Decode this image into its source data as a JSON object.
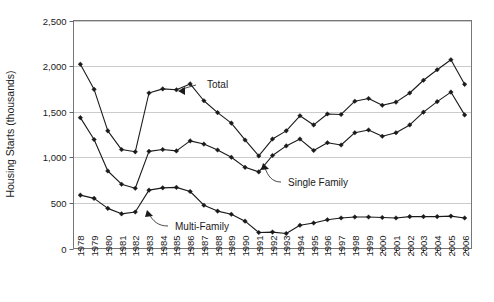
{
  "chart_data": {
    "type": "line",
    "title": "",
    "xlabel": "",
    "ylabel": "Housing Starts (thousands)",
    "ylim": [
      0,
      2500
    ],
    "yticks": [
      0,
      500,
      1000,
      1500,
      2000,
      2500
    ],
    "ytick_labels": [
      "0",
      "500",
      "1,000",
      "1,500",
      "2,000",
      "2,500"
    ],
    "grid": true,
    "legend_position": "inline-annotations",
    "categories": [
      "1978",
      "1979",
      "1980",
      "1981",
      "1982",
      "1983",
      "1984",
      "1985",
      "1986",
      "1987",
      "1988",
      "1989",
      "1990",
      "1991",
      "1992",
      "1993",
      "1994",
      "1995",
      "1996",
      "1997",
      "1998",
      "1999",
      "2000",
      "2001",
      "2002",
      "2003",
      "2004",
      "2005",
      "2006"
    ],
    "series": [
      {
        "name": "Total",
        "values": [
          2020,
          1745,
          1290,
          1085,
          1060,
          1705,
          1750,
          1740,
          1805,
          1620,
          1490,
          1375,
          1190,
          1015,
          1200,
          1290,
          1455,
          1355,
          1475,
          1470,
          1615,
          1645,
          1570,
          1605,
          1705,
          1845,
          1960,
          2070,
          1800
        ]
      },
      {
        "name": "Single Family",
        "values": [
          1435,
          1195,
          850,
          705,
          660,
          1065,
          1085,
          1070,
          1180,
          1145,
          1080,
          1000,
          890,
          840,
          1020,
          1125,
          1200,
          1075,
          1160,
          1135,
          1270,
          1300,
          1230,
          1270,
          1355,
          1495,
          1610,
          1715,
          1465
        ]
      },
      {
        "name": "Multi-Family",
        "values": [
          585,
          550,
          440,
          380,
          400,
          640,
          665,
          670,
          625,
          475,
          410,
          375,
          300,
          175,
          180,
          165,
          255,
          280,
          315,
          335,
          345,
          345,
          340,
          335,
          350,
          350,
          350,
          355,
          335
        ]
      }
    ],
    "annotations": [
      {
        "text": "Total",
        "series": "Total",
        "anchor_year": "1986"
      },
      {
        "text": "Single Family",
        "series": "Single Family",
        "anchor_year": "1991"
      },
      {
        "text": "Multi-Family",
        "series": "Multi-Family",
        "anchor_year": "1982"
      }
    ],
    "colors": {
      "line": "#1a1a1a",
      "grid": "#b5b5b5",
      "frame": "#777777",
      "background": "#ffffff"
    }
  }
}
